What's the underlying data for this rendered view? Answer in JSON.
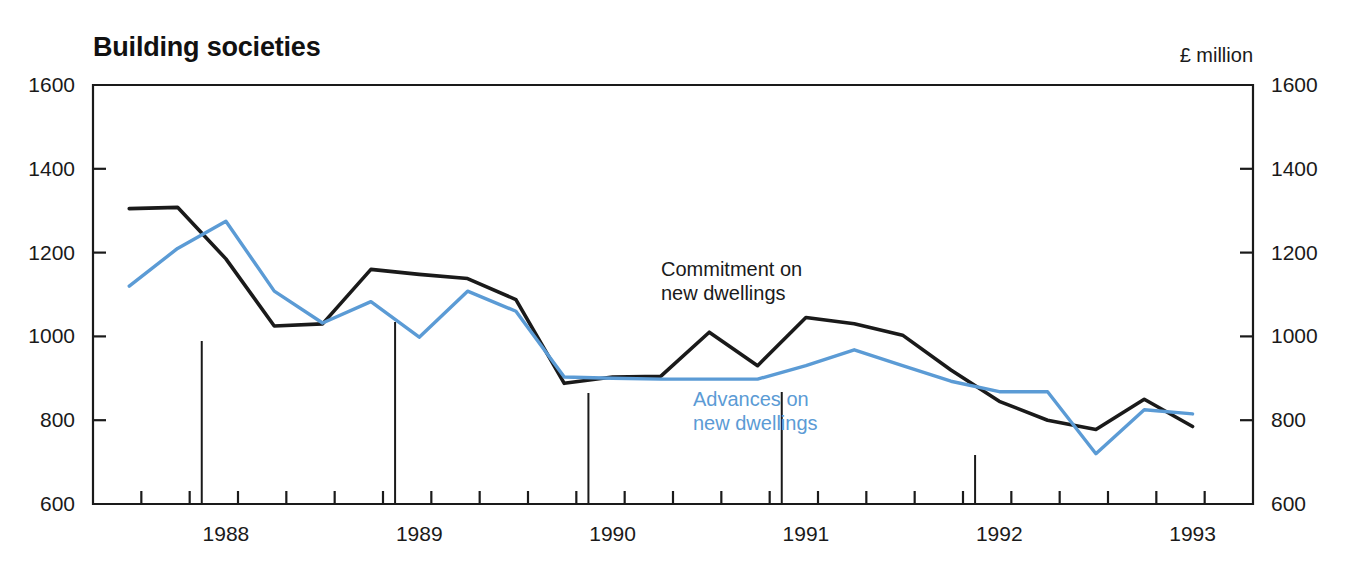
{
  "chart_data": {
    "type": "line",
    "title": "Building societies",
    "unit_label": "£ million",
    "xlabel": "",
    "ylabel": "",
    "ylim": [
      600,
      1600
    ],
    "yticks": [
      600,
      800,
      1000,
      1200,
      1400,
      1600
    ],
    "ytick_labels_left": [
      "600",
      "800",
      "1000",
      "1200",
      "1400",
      "1600"
    ],
    "ytick_labels_right": [
      "600",
      "800",
      "1000",
      "1200",
      "1400",
      "1600"
    ],
    "grid": false,
    "legend_position": "inline-annotation",
    "x_year_labels": [
      "1988",
      "1989",
      "1990",
      "1991",
      "1992",
      "1993"
    ],
    "x_quarters": [
      "1987Q4",
      "1988Q1",
      "1988Q2",
      "1988Q3",
      "1988Q4",
      "1989Q1",
      "1989Q2",
      "1989Q3",
      "1989Q4",
      "1990Q1",
      "1990Q2",
      "1990Q3",
      "1990Q4",
      "1991Q1",
      "1991Q2",
      "1991Q3",
      "1991Q4",
      "1992Q1",
      "1992Q2",
      "1992Q3",
      "1992Q4",
      "1993Q1",
      "1993Q2"
    ],
    "series": [
      {
        "name": "Commitment on new dwellings",
        "color": "#1a1a1a",
        "values": [
          1305,
          1308,
          1185,
          1025,
          1030,
          1160,
          1148,
          1138,
          1088,
          888,
          903,
          905,
          1010,
          930,
          1045,
          1030,
          1003,
          920,
          845,
          800,
          778,
          850,
          785
        ]
      },
      {
        "name": "Advances on new dwellings",
        "color": "#5b9bd5",
        "values": [
          1120,
          1210,
          1275,
          1108,
          1032,
          1083,
          998,
          1108,
          1060,
          903,
          900,
          898,
          898,
          898,
          930,
          968,
          930,
          893,
          868,
          868,
          720,
          825,
          815
        ]
      }
    ],
    "annotations": [
      {
        "text_line1": "Commitment on",
        "text_line2": "new dwellings",
        "color": "#1a1a1a"
      },
      {
        "text_line1": "Advances on",
        "text_line2": "new dwellings",
        "color": "#5b9bd5"
      }
    ],
    "year_separators": [
      "1988Q2",
      "1989Q2",
      "1990Q2",
      "1991Q2",
      "1992Q2"
    ]
  }
}
